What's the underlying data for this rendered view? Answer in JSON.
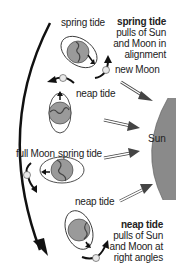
{
  "diagram": {
    "labels": {
      "spring_tide_top": "spring tide",
      "new_moon": "new Moon",
      "neap_tide_upper": "neap tide",
      "full_moon": "full Moon",
      "spring_tide_mid": "spring tide",
      "neap_tide_lower": "neap tide",
      "sun": "Sun"
    },
    "callouts": {
      "spring": {
        "title": "spring tide",
        "line1": "pulls of Sun",
        "line2": "and Moon in",
        "line3": "alignment"
      },
      "neap": {
        "title": "neap tide",
        "line1": "pulls of Sun",
        "line2": "and Moon at",
        "line3": "right angles"
      }
    },
    "colors": {
      "sun": "#8a8a8a",
      "earth": "#9a9a9a",
      "land": "#7a7a7a",
      "moon": "#e8e8e8",
      "arrow": "#111111",
      "ray_fill": "#ffffff",
      "ray_head": "#444444"
    }
  }
}
